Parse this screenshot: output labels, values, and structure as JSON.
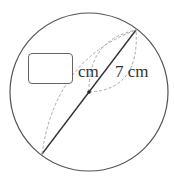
{
  "diagram": {
    "type": "circle-diameter",
    "circle": {
      "cx": 89,
      "cy": 92,
      "r": 79
    },
    "diameter_line": {
      "x1": 42,
      "y1": 154,
      "x2": 136,
      "y2": 30
    },
    "center_point": {
      "x": 89,
      "y": 92
    },
    "radius_label": "7 cm",
    "answer_box_unit": "cm",
    "answer_box_value": "",
    "colors": {
      "stroke": "#444444",
      "dashed": "#aaaaaa",
      "text": "#333333"
    }
  }
}
